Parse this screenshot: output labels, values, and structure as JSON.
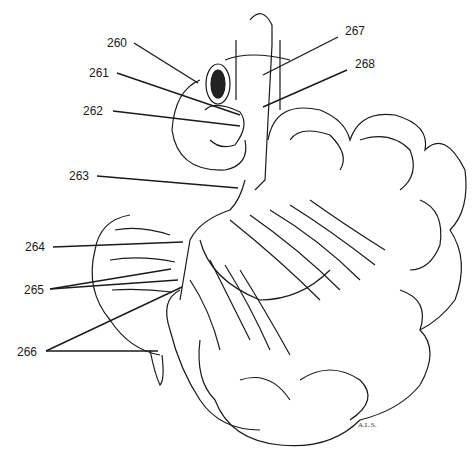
{
  "figure": {
    "artist_signature": "A.L.S."
  },
  "labels": [
    {
      "id": "260",
      "text": "260",
      "x": 107,
      "y": 36
    },
    {
      "id": "261",
      "text": "261",
      "x": 89,
      "y": 66
    },
    {
      "id": "262",
      "text": "262",
      "x": 83,
      "y": 104
    },
    {
      "id": "263",
      "text": "263",
      "x": 69,
      "y": 169
    },
    {
      "id": "264",
      "text": "264",
      "x": 25,
      "y": 240
    },
    {
      "id": "265",
      "text": "265",
      "x": 24,
      "y": 283
    },
    {
      "id": "266",
      "text": "266",
      "x": 17,
      "y": 345
    },
    {
      "id": "267",
      "text": "267",
      "x": 345,
      "y": 24
    },
    {
      "id": "268",
      "text": "268",
      "x": 355,
      "y": 57
    }
  ],
  "colors": {
    "line": "#1a1a1a",
    "background": "#ffffff"
  }
}
